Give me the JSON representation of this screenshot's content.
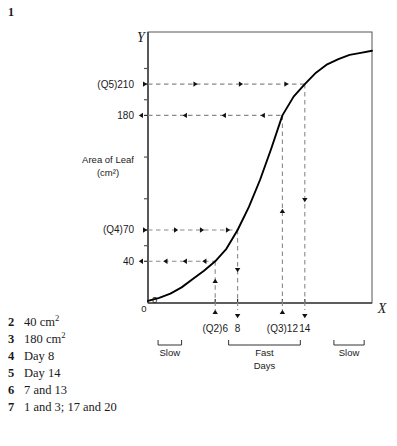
{
  "figure": {
    "number": "1"
  },
  "chart_data": {
    "type": "line",
    "title": "",
    "xlabel": "Days",
    "ylabel": "Area of Leaf",
    "ylabel_units": "(cm²)",
    "x_axis_name": "X",
    "y_axis_name": "Y",
    "origin_label": "0",
    "origin_label_y": "0",
    "xlim": [
      0,
      20
    ],
    "ylim": [
      0,
      260
    ],
    "grid": false,
    "legend": null,
    "x_tick_values": [
      6,
      8,
      12,
      14
    ],
    "x_tick_labels": [
      "(Q2)6",
      "8",
      "(Q3)12",
      "14"
    ],
    "y_tick_values": [
      40,
      70,
      180,
      210
    ],
    "y_tick_labels": [
      "40",
      "(Q4)70",
      "180",
      "(Q5)210"
    ],
    "y_minor_ticks": [
      55,
      100,
      140,
      195,
      225
    ],
    "x": [
      0,
      1,
      2,
      3,
      4,
      5,
      6,
      7,
      8,
      9,
      10,
      11,
      12,
      13,
      14,
      15,
      16,
      17,
      18,
      19,
      20
    ],
    "values": [
      2,
      5,
      9,
      15,
      23,
      31,
      40,
      52,
      70,
      92,
      118,
      148,
      180,
      198,
      210,
      221,
      229,
      234,
      238,
      240,
      242
    ],
    "annotations": [
      {
        "name": "q5-210-trace",
        "label": "(Q5)210",
        "axis": "y",
        "value": 210,
        "direction": "right",
        "meaning": "Area at day 14"
      },
      {
        "name": "y-180-trace",
        "label": "180",
        "axis": "y",
        "value": 180,
        "direction": "left",
        "meaning": "Area at day 12"
      },
      {
        "name": "q4-70-trace",
        "label": "(Q4)70",
        "axis": "y",
        "value": 70,
        "direction": "right",
        "meaning": "Area at day 8"
      },
      {
        "name": "y-40-trace",
        "label": "40",
        "axis": "y",
        "value": 40,
        "direction": "left",
        "meaning": "Area at day 6"
      },
      {
        "name": "q2-day6-trace",
        "label": "(Q2)6",
        "axis": "x",
        "value": 6,
        "direction": "up",
        "meaning": "Day for 40 cm2"
      },
      {
        "name": "day8-trace",
        "label": "8",
        "axis": "x",
        "value": 8,
        "direction": "down",
        "meaning": "Day for 70 cm2"
      },
      {
        "name": "q3-day12-trace",
        "label": "(Q3)12",
        "axis": "x",
        "value": 12,
        "direction": "up",
        "meaning": "Day for 180 cm2"
      },
      {
        "name": "day14-trace",
        "label": "14",
        "axis": "x",
        "value": 14,
        "direction": "down",
        "meaning": "Day for 210 cm2"
      }
    ],
    "phase_brackets": [
      {
        "name": "slow-early",
        "label": "Slow",
        "from": 0.9,
        "to": 3.0
      },
      {
        "name": "fast",
        "label": "Fast",
        "from": 7.2,
        "to": 13.6
      },
      {
        "name": "slow-late",
        "label": "Slow",
        "from": 16.6,
        "to": 19.3
      }
    ]
  },
  "answers": [
    {
      "num": "2",
      "text": "40 cm",
      "sup": "2"
    },
    {
      "num": "3",
      "text": "180 cm",
      "sup": "2"
    },
    {
      "num": "4",
      "text": "Day 8",
      "sup": ""
    },
    {
      "num": "5",
      "text": "Day 14",
      "sup": ""
    },
    {
      "num": "6",
      "text": "7 and 13",
      "sup": ""
    },
    {
      "num": "7",
      "text": "1 and 3; 17 and 20",
      "sup": ""
    }
  ],
  "colors": {
    "ink": "#1a1a1a",
    "curve": "#000000",
    "axis": "#555555",
    "dashed": "#8a8a8a",
    "arrowhead": "#111111"
  }
}
